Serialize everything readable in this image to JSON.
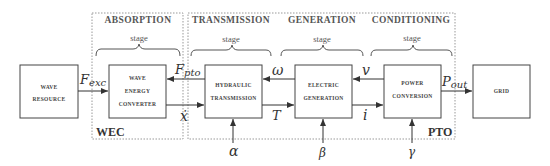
{
  "regions": {
    "wec": {
      "label": "WEC"
    },
    "pto": {
      "label": "PTO"
    }
  },
  "stages": [
    {
      "title": "ABSORPTION",
      "sub": "stage"
    },
    {
      "title": "TRANSMISSION",
      "sub": "stage"
    },
    {
      "title": "GENERATION",
      "sub": "stage"
    },
    {
      "title": "CONDITIONING",
      "sub": "stage"
    }
  ],
  "blocks": {
    "wave_resource": {
      "line1": "WAVE",
      "line2": "RESOURCE"
    },
    "wec": {
      "line1": "WAVE",
      "line2": "ENERGY",
      "line3": "CONVERTER"
    },
    "hydraulic": {
      "line1": "HYDRAULIC",
      "line2": "TRANSMISSION"
    },
    "electric": {
      "line1": "ELECTRIC",
      "line2": "GENERATION"
    },
    "power": {
      "line1": "POWER",
      "line2": "CONVERSION"
    },
    "grid": {
      "line1": "GRID"
    }
  },
  "signals": {
    "f_exc_main": "F",
    "f_exc_sub": "exc",
    "f_pto_main": "F",
    "f_pto_sub": "pto",
    "x_dot": "ẋ",
    "omega": "ω",
    "torque": "T",
    "voltage": "v",
    "current": "i",
    "p_out_main": "P",
    "p_out_sub": "out",
    "alpha": "α",
    "beta": "β",
    "gamma": "γ"
  },
  "colors": {
    "line": "#333333",
    "dashed": "#999999",
    "background": "#ffffff"
  }
}
